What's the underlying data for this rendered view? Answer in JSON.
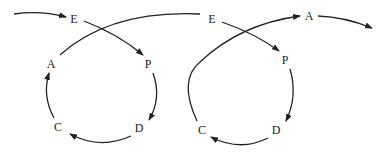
{
  "diagram": {
    "title": "",
    "cycle1": {
      "nodes": [
        {
          "id": "E1",
          "label": "E",
          "x": 74,
          "y": 19
        },
        {
          "id": "P1",
          "label": "P",
          "x": 148,
          "y": 64
        },
        {
          "id": "D1",
          "label": "D",
          "x": 139,
          "y": 128
        },
        {
          "id": "C1",
          "label": "C",
          "x": 58,
          "y": 127
        },
        {
          "id": "A1",
          "label": "A",
          "x": 51,
          "y": 64
        }
      ]
    },
    "cycle2": {
      "nodes": [
        {
          "id": "E2",
          "label": "E",
          "x": 212,
          "y": 19
        },
        {
          "id": "P2",
          "label": "P",
          "x": 285,
          "y": 60
        },
        {
          "id": "D2",
          "label": "D",
          "x": 276,
          "y": 130
        },
        {
          "id": "C2",
          "label": "C",
          "x": 202,
          "y": 130
        },
        {
          "id": "A2",
          "label": "A",
          "x": 309,
          "y": 16
        }
      ]
    },
    "edges": [
      "start -> E1",
      "E1 -> P1",
      "P1 -> D1",
      "D1 -> C1",
      "C1 -> A1",
      "A1 -> E2",
      "E2 -> P2",
      "P2 -> D2",
      "D2 -> C2",
      "C2 -> A2",
      "A2 -> end"
    ],
    "stroke_color": "#222222"
  }
}
